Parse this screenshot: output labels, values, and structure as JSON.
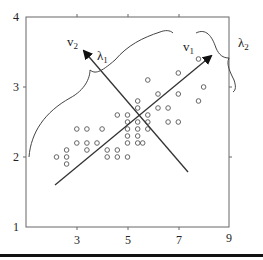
{
  "chart_data": {
    "type": "scatter",
    "title": "",
    "xlabel": "",
    "ylabel": "",
    "xlim": [
      1,
      9
    ],
    "ylim": [
      1,
      4
    ],
    "grid": false,
    "legend": null,
    "x_ticks": [
      "3",
      "5",
      "7",
      "9"
    ],
    "y_ticks": [
      "1",
      "2",
      "3",
      "4"
    ],
    "series": [
      {
        "name": "observations",
        "marker": "open-circle",
        "points": [
          [
            2.2,
            2.0
          ],
          [
            2.6,
            2.0
          ],
          [
            2.6,
            2.1
          ],
          [
            2.6,
            1.9
          ],
          [
            3.0,
            2.2
          ],
          [
            3.4,
            2.2
          ],
          [
            3.4,
            2.1
          ],
          [
            3.8,
            2.2
          ],
          [
            3.4,
            2.4
          ],
          [
            3.0,
            2.4
          ],
          [
            4.0,
            2.4
          ],
          [
            4.2,
            2.1
          ],
          [
            4.2,
            2.0
          ],
          [
            4.6,
            2.1
          ],
          [
            4.6,
            2.0
          ],
          [
            5.0,
            2.0
          ],
          [
            4.6,
            2.6
          ],
          [
            5.0,
            2.6
          ],
          [
            5.0,
            2.5
          ],
          [
            5.0,
            2.4
          ],
          [
            5.0,
            2.3
          ],
          [
            5.0,
            2.2
          ],
          [
            5.4,
            2.5
          ],
          [
            5.4,
            2.4
          ],
          [
            5.4,
            2.3
          ],
          [
            5.4,
            2.2
          ],
          [
            5.4,
            2.7
          ],
          [
            5.4,
            2.8
          ],
          [
            5.8,
            2.5
          ],
          [
            5.8,
            2.4
          ],
          [
            5.8,
            2.6
          ],
          [
            5.6,
            2.2
          ],
          [
            6.2,
            2.7
          ],
          [
            6.6,
            2.7
          ],
          [
            6.2,
            2.9
          ],
          [
            6.6,
            2.5
          ],
          [
            5.8,
            3.1
          ],
          [
            7.0,
            3.2
          ],
          [
            7.0,
            2.9
          ],
          [
            7.0,
            2.5
          ],
          [
            7.8,
            2.8
          ],
          [
            8.0,
            3.0
          ],
          [
            7.8,
            3.4
          ]
        ]
      }
    ],
    "annotations": [
      {
        "type": "arrow",
        "label": "v1",
        "from": [
          2.15,
          1.6
        ],
        "to": [
          8.3,
          3.45
        ]
      },
      {
        "type": "arrow",
        "label": "v2",
        "from": [
          7.3,
          1.8
        ],
        "to": [
          3.2,
          3.6
        ]
      },
      {
        "type": "brace",
        "label": "λ1",
        "along": "v1-direction (spread, long axis)"
      },
      {
        "type": "brace",
        "label": "λ2",
        "along": "v2-direction (spread, short axis)"
      }
    ]
  },
  "labels": {
    "v1": "v",
    "v1_sub": "1",
    "v2": "v",
    "v2_sub": "2",
    "lambda1": "λ",
    "lambda1_sub": "1",
    "lambda2": "λ",
    "lambda2_sub": "2"
  },
  "colors": {
    "axis": "#555555",
    "line": "#333333",
    "marker": "#666666"
  }
}
